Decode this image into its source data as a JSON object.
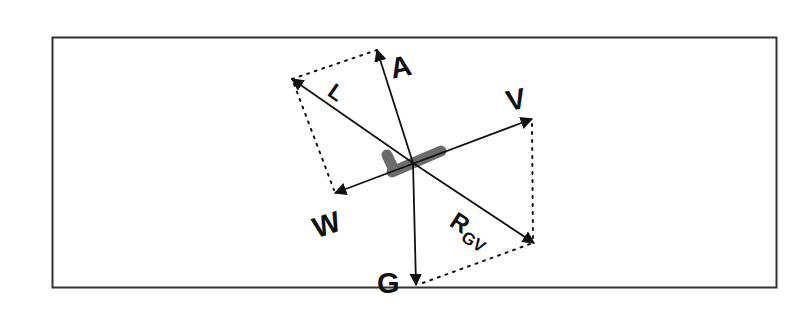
{
  "figure": {
    "frame_color": "#333333",
    "vector_color": "#111111",
    "aircraft_color": "#6b6b6b",
    "origin": [
      413,
      163
    ]
  },
  "vectors": [
    {
      "id": "A",
      "label": "A",
      "tip": [
        377,
        50
      ]
    },
    {
      "id": "L",
      "label": "L",
      "tip": [
        292,
        79
      ]
    },
    {
      "id": "V",
      "label": "V",
      "tip": [
        532,
        119
      ]
    },
    {
      "id": "W",
      "label": "W",
      "tip": [
        335,
        193
      ]
    },
    {
      "id": "G",
      "label": "G",
      "tip": [
        416,
        285
      ]
    },
    {
      "id": "RGV",
      "label": "R",
      "subscript": "GV",
      "tip": [
        534,
        243
      ]
    }
  ],
  "labels": {
    "A": "A",
    "L": "L",
    "V": "V",
    "W": "W",
    "G": "G",
    "R": "R",
    "GV": "GV"
  }
}
